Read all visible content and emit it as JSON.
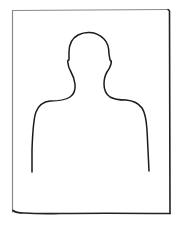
{
  "image": {
    "subject": "portrait-placeholder",
    "description": "Hand-drawn style blank photo frame with a head-and-shoulders silhouette outline",
    "colors": {
      "background": "#ffffff",
      "stroke": "#1a1a1a",
      "frame_top_left_stroke": "#8a8a8a"
    }
  }
}
